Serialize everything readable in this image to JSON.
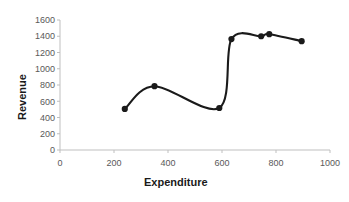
{
  "chart_data": {
    "type": "line",
    "title": "",
    "xlabel": "Expenditure",
    "ylabel": "Revenue",
    "xlim": [
      0,
      1000
    ],
    "ylim": [
      0,
      1600
    ],
    "xticks": [
      0,
      200,
      400,
      600,
      800,
      1000
    ],
    "yticks": [
      0,
      200,
      400,
      600,
      800,
      1000,
      1200,
      1400,
      1600
    ],
    "grid": false,
    "legend": false,
    "smooth": true,
    "marker": "circle",
    "series": [
      {
        "name": "Revenue vs Expenditure",
        "color": "#1a1a1a",
        "points": [
          {
            "x": 240,
            "y": 505
          },
          {
            "x": 350,
            "y": 785
          },
          {
            "x": 590,
            "y": 517
          },
          {
            "x": 635,
            "y": 1365
          },
          {
            "x": 745,
            "y": 1400
          },
          {
            "x": 775,
            "y": 1425
          },
          {
            "x": 895,
            "y": 1340
          }
        ]
      }
    ]
  },
  "axis": {
    "x_title": "Expenditure",
    "y_title": "Revenue",
    "x_tick_labels": [
      "0",
      "200",
      "400",
      "600",
      "800",
      "1000"
    ],
    "y_tick_labels": [
      "0",
      "200",
      "400",
      "600",
      "800",
      "1000",
      "1200",
      "1400",
      "1600"
    ]
  },
  "colors": {
    "line": "#1a1a1a",
    "marker": "#1a1a1a",
    "axis": "#bfbfbf",
    "tick_text": "#595959",
    "title_text": "#1a1a1a",
    "background": "#ffffff"
  }
}
